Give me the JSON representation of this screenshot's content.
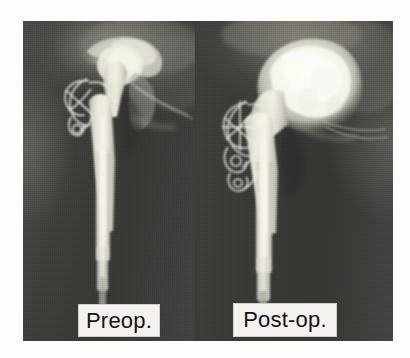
{
  "figure": {
    "kind": "radiograph-comparison",
    "modality": "X-ray",
    "anatomy": "hip",
    "procedure": "revision total hip arthroplasty",
    "background_color": "#fdfdfb",
    "film_dark_color": "#3a3a38",
    "bone_bright_color": "#e8e6da",
    "implant_bright_color": "#f2f0e6",
    "label_box_color": "#f3f2ee",
    "label_text_color": "#141414"
  },
  "panels": [
    {
      "id": "preop",
      "label": "Preop.",
      "position": "left",
      "features": [
        "femoral stem prosthesis",
        "cerclage wire loops",
        "acetabulum",
        "greater trochanter",
        "femoral shaft"
      ]
    },
    {
      "id": "postop",
      "label": "Post-op.",
      "position": "right",
      "features": [
        "bone graft mass",
        "acetabular reconstruction",
        "femoral stem prosthesis",
        "cerclage wire loops",
        "femoral shaft"
      ]
    }
  ]
}
